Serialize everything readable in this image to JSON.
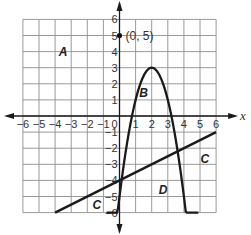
{
  "chart_data": {
    "type": "line",
    "title": "",
    "xlabel": "x",
    "ylabel": "",
    "xlim": [
      -6,
      6
    ],
    "ylim": [
      -6,
      6
    ],
    "grid": true,
    "x_ticks": [
      -6,
      -5,
      -4,
      -3,
      -2,
      -1,
      1,
      2,
      3,
      4,
      5,
      6
    ],
    "y_ticks": [
      -6,
      -5,
      -4,
      -3,
      -2,
      -1,
      1,
      2,
      3,
      4,
      5,
      6
    ],
    "origin_label": "0",
    "series": [
      {
        "name": "parabola",
        "kind": "curve",
        "equation": "y = -2(x-2)^2 + 3",
        "vertex": [
          2,
          3
        ],
        "x": [
          -0.75,
          -0.5,
          0,
          0.5,
          1,
          1.5,
          2,
          2.5,
          3,
          3.5,
          4,
          4.5,
          4.75
        ],
        "values": [
          -12.125,
          -9.5,
          -5,
          -1.5,
          1,
          2.5,
          3,
          2.5,
          1,
          -1.5,
          -5,
          -9.5,
          -12.125
        ],
        "visible_x_range": [
          -0.8,
          4.9
        ]
      },
      {
        "name": "line",
        "kind": "segment",
        "equation": "y = 0.5x - 4",
        "x": [
          -4,
          6
        ],
        "values": [
          -6,
          -1
        ]
      }
    ],
    "points": [
      {
        "x": 0,
        "y": 5,
        "label": "(0, 5)"
      }
    ],
    "region_labels": [
      {
        "label": "A",
        "x": -3.5,
        "y": 4
      },
      {
        "label": "B",
        "x": 1.5,
        "y": 1.4
      },
      {
        "label": "C",
        "x": 5.3,
        "y": -2.7
      },
      {
        "label": "C",
        "x": -1.4,
        "y": -5.5
      },
      {
        "label": "D",
        "x": 2.7,
        "y": -4.6
      }
    ]
  },
  "layout": {
    "origin_px": [
      119.5,
      116
    ],
    "unit_px": 16.1
  }
}
